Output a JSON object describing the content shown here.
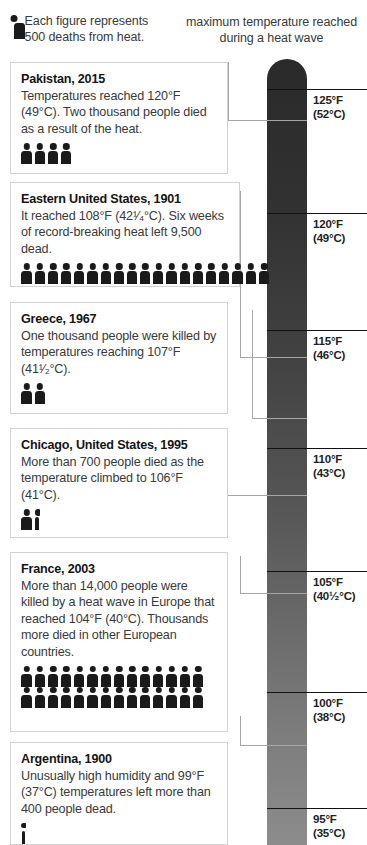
{
  "legend": {
    "icon": "person-pictogram-icon",
    "line1": "Each figure represents",
    "line2": "500 deaths from heat."
  },
  "scale_caption": {
    "line1": "maximum temperature reached",
    "line2": "during a heat wave"
  },
  "chart_data": {
    "type": "bar",
    "subtitle": "maximum temperature reached during a heat wave",
    "unit_note": "Each figure represents 500 deaths from heat.",
    "figure_unit_deaths": 500,
    "xlabel": "",
    "ylabel": "maximum temperature reached during a heat wave",
    "axis_ticks_f": [
      125,
      120,
      115,
      110,
      105,
      100,
      95
    ],
    "axis_ticks_c": [
      "52",
      "49",
      "46",
      "43",
      "40¹⁄₂",
      "38",
      "35"
    ],
    "axis_tick_labels": [
      {
        "f": "125°F",
        "c": "(52°C)"
      },
      {
        "f": "120°F",
        "c": "(49°C)"
      },
      {
        "f": "115°F",
        "c": "(46°C)"
      },
      {
        "f": "110°F",
        "c": "(43°C)"
      },
      {
        "f": "105°F",
        "c": "(40¹⁄₂°C)"
      },
      {
        "f": "100°F",
        "c": "(38°C)"
      },
      {
        "f": "95°F",
        "c": "(35°C)"
      }
    ],
    "ylim_f": [
      95,
      127
    ],
    "categories": [
      "Pakistan, 2015",
      "Eastern United States, 1901",
      "Greece, 1967",
      "Chicago, United States, 1995",
      "France, 2003",
      "Argentina, 1900"
    ],
    "values": [
      120,
      108,
      107,
      106,
      104,
      99
    ],
    "deaths": [
      2000,
      9500,
      1000,
      700,
      14000,
      400
    ],
    "figures": [
      4,
      19,
      2,
      1.4,
      28,
      0.8
    ],
    "grid": false,
    "legend_position": "top-left"
  },
  "events": [
    {
      "title": "Pakistan, 2015",
      "body": "Temperatures reached 120°F (49°C). Two thousand people died as a result of the heat.",
      "deaths": 2000,
      "temp_f": 120,
      "figures_full": 4,
      "figures_partial": 0
    },
    {
      "title": "Eastern United States, 1901",
      "body": "It reached 108°F (42¹⁄₄°C). Six weeks of record-breaking heat left 9,500 dead.",
      "deaths": 9500,
      "temp_f": 108,
      "figures_full": 19,
      "figures_partial": 0
    },
    {
      "title": "Greece, 1967",
      "body": "One thousand people were killed by temperatures reaching 107°F (41¹⁄₂°C).",
      "deaths": 1000,
      "temp_f": 107,
      "figures_full": 2,
      "figures_partial": 0
    },
    {
      "title": "Chicago, United States, 1995",
      "body": "More than 700 people died as the temperature climbed to 106°F (41°C).",
      "deaths": 700,
      "temp_f": 106,
      "figures_full": 1,
      "figures_partial": 1
    },
    {
      "title": "France, 2003",
      "body": "More than 14,000 people were killed by a heat wave in Europe that reached 104°F (40°C). Thousands more died in other European countries.",
      "deaths": 14000,
      "temp_f": 104,
      "figures_full": 28,
      "figures_partial": 0
    },
    {
      "title": "Argentina, 1900",
      "body": "Unusually high humidity and 99°F (37°C) temperatures left more than 400 people dead.",
      "deaths": 400,
      "temp_f": 99,
      "figures_full": 0,
      "figures_partial": 1
    }
  ],
  "colors": {
    "thermo_top": "#2a2a2a",
    "thermo_bottom": "#8c8c8c",
    "figure": "#1a1a1a",
    "box_border": "#d2d2d2",
    "connector": "#a6a6a6",
    "text": "#3a3a3a",
    "heading": "#151515",
    "background": "#ffffff"
  }
}
